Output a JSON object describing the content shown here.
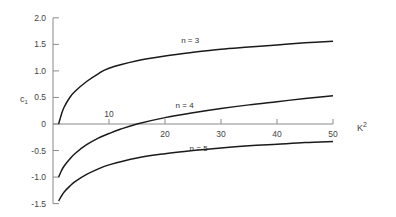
{
  "chart_data": {
    "type": "line",
    "title": "",
    "xlabel": "K²",
    "ylabel": "c₁",
    "xlim": [
      0,
      50
    ],
    "ylim": [
      -1.5,
      2.0
    ],
    "grid": false,
    "legend": "inline curve labels",
    "x_ticks": [
      10,
      20,
      30,
      40,
      50
    ],
    "x_tick_labels": [
      "10",
      "20",
      "30",
      "40",
      "50"
    ],
    "y_ticks": [
      2.0,
      1.5,
      1.0,
      0.5,
      0,
      -0.5,
      -1.0,
      -1.5
    ],
    "y_tick_labels": [
      "2.0",
      "1.5",
      "1.0",
      "0.5",
      "0",
      "-0.5",
      "-1.0",
      "-1.5"
    ],
    "series": [
      {
        "name": "n = 3",
        "x": [
          1,
          1.5,
          2,
          3,
          4,
          6,
          8,
          10,
          15,
          20,
          25,
          30,
          35,
          40,
          45,
          50
        ],
        "values": [
          0.0,
          0.18,
          0.32,
          0.5,
          0.62,
          0.8,
          0.94,
          1.05,
          1.19,
          1.28,
          1.35,
          1.41,
          1.45,
          1.49,
          1.53,
          1.56
        ],
        "label_at": [
          24.5,
          1.52
        ]
      },
      {
        "name": "n = 4",
        "x": [
          1,
          1.5,
          2,
          3,
          4,
          6,
          8,
          10,
          12,
          15,
          20,
          25,
          30,
          35,
          40,
          45,
          50
        ],
        "values": [
          -1.0,
          -0.88,
          -0.79,
          -0.66,
          -0.55,
          -0.39,
          -0.27,
          -0.18,
          -0.1,
          0.0,
          0.12,
          0.21,
          0.29,
          0.36,
          0.42,
          0.48,
          0.53
        ],
        "label_at": [
          23.5,
          0.3
        ]
      },
      {
        "name": "n = 5",
        "x": [
          1,
          1.5,
          2,
          3,
          4,
          6,
          8,
          10,
          15,
          20,
          25,
          30,
          35,
          40,
          45,
          50
        ],
        "values": [
          -1.45,
          -1.36,
          -1.28,
          -1.17,
          -1.08,
          -0.95,
          -0.85,
          -0.77,
          -0.64,
          -0.56,
          -0.5,
          -0.45,
          -0.41,
          -0.38,
          -0.35,
          -0.33
        ],
        "label_at": [
          26,
          -0.5
        ]
      }
    ]
  },
  "labels": {
    "y_axis": "c",
    "y_axis_sub": "1",
    "x_axis": "K",
    "x_axis_sup": "2"
  }
}
